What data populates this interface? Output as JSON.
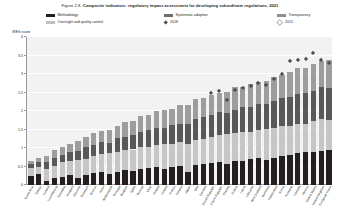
{
  "title": {
    "figure_number": "Figure 2.8.",
    "text": "Composite indicators: regulatory impact assessment for developing subordinate regulations, 2021"
  },
  "legend": {
    "items": [
      {
        "label": "Methodology",
        "type": "swatch",
        "color": "#231f20",
        "key": "meth"
      },
      {
        "label": "Systematic adoption",
        "type": "swatch",
        "color": "#6d6d6d",
        "key": "syst"
      },
      {
        "label": "Transparency",
        "type": "swatch",
        "color": "#8f8f8f",
        "key": "tran"
      },
      {
        "label": "Oversight and quality control",
        "type": "swatch",
        "color": "#bfbfbf",
        "key": "over"
      },
      {
        "label": "2018",
        "type": "diamond-filled",
        "color": "#4d4d4d",
        "key": "y2018"
      },
      {
        "label": "2015",
        "type": "diamond-open",
        "color": "#ffffff",
        "key": "y2015"
      }
    ]
  },
  "chart_data": {
    "type": "bar",
    "stacked": true,
    "title": "Composite indicators: regulatory impact assessment for developing subordinate regulations, 2021",
    "xlabel": "",
    "ylabel": "iREG score",
    "ylim": [
      0,
      4
    ],
    "yticks": [
      0,
      0.5,
      1,
      1.5,
      2,
      2.5,
      3,
      3.5,
      4
    ],
    "ytick_labels": [
      "0",
      "0.5",
      "1",
      "1.5",
      "2",
      "2.5",
      "3",
      "3.5",
      "4"
    ],
    "grid": true,
    "legend_position": "top",
    "categories": [
      "Costa Rica",
      "Türkiye",
      "Iceland",
      "Luxembourg",
      "Colombia",
      "Hungary",
      "Slovenia",
      "Denmark",
      "Greece",
      "Israel",
      "Netherlands",
      "Portugal",
      "Belgium",
      "Spain",
      "Norway",
      "Chile",
      "Poland",
      "Ireland",
      "France",
      "Finland",
      "Japan",
      "Italy",
      "Sweden",
      "Slovak Republic",
      "Czech Republic",
      "Estonia",
      "Austria",
      "Latvia",
      "Lithuania",
      "New Zealand",
      "Germany",
      "Switzerland",
      "Korea",
      "Australia",
      "Canada",
      "Mexico",
      "United States",
      "United Kingdom",
      "European Union"
    ],
    "series": [
      {
        "name": "Methodology",
        "color": "#231f20",
        "values": [
          0.25,
          0.3,
          0.12,
          0.18,
          0.22,
          0.28,
          0.2,
          0.26,
          0.32,
          0.34,
          0.3,
          0.36,
          0.4,
          0.38,
          0.42,
          0.46,
          0.5,
          0.44,
          0.48,
          0.52,
          0.36,
          0.55,
          0.58,
          0.6,
          0.62,
          0.58,
          0.64,
          0.66,
          0.7,
          0.72,
          0.68,
          0.74,
          0.78,
          0.82,
          0.86,
          0.9,
          0.88,
          0.92,
          0.95
        ]
      },
      {
        "name": "Oversight and quality control",
        "color": "#c6c6c6",
        "values": [
          0.22,
          0.18,
          0.3,
          0.34,
          0.4,
          0.36,
          0.48,
          0.44,
          0.46,
          0.5,
          0.56,
          0.52,
          0.54,
          0.58,
          0.6,
          0.56,
          0.58,
          0.66,
          0.62,
          0.64,
          0.74,
          0.68,
          0.66,
          0.7,
          0.72,
          0.8,
          0.76,
          0.78,
          0.74,
          0.76,
          0.84,
          0.8,
          0.82,
          0.78,
          0.8,
          0.76,
          0.84,
          0.86,
          0.8
        ]
      },
      {
        "name": "Systematic adoption",
        "color": "#585858",
        "values": [
          0.1,
          0.14,
          0.2,
          0.22,
          0.18,
          0.26,
          0.24,
          0.34,
          0.3,
          0.32,
          0.28,
          0.38,
          0.36,
          0.4,
          0.42,
          0.48,
          0.46,
          0.44,
          0.52,
          0.5,
          0.54,
          0.56,
          0.6,
          0.58,
          0.62,
          0.56,
          0.64,
          0.66,
          0.68,
          0.7,
          0.66,
          0.72,
          0.74,
          0.78,
          0.8,
          0.84,
          0.82,
          0.86,
          0.88
        ]
      },
      {
        "name": "Transparency",
        "color": "#9d9d9d",
        "values": [
          0.08,
          0.12,
          0.16,
          0.2,
          0.24,
          0.22,
          0.28,
          0.26,
          0.32,
          0.3,
          0.36,
          0.34,
          0.4,
          0.38,
          0.42,
          0.4,
          0.46,
          0.48,
          0.44,
          0.5,
          0.52,
          0.54,
          0.5,
          0.56,
          0.54,
          0.58,
          0.6,
          0.56,
          0.62,
          0.6,
          0.64,
          0.66,
          0.62,
          0.68,
          0.7,
          0.66,
          0.72,
          0.7,
          0.74
        ]
      }
    ],
    "markers": [
      {
        "name": "2018",
        "color": "#4d4d4d",
        "shape": "diamond-filled",
        "values": [
          null,
          null,
          null,
          null,
          null,
          null,
          null,
          null,
          null,
          null,
          null,
          null,
          null,
          null,
          null,
          null,
          null,
          null,
          null,
          null,
          null,
          null,
          null,
          2.5,
          2.55,
          2.3,
          2.58,
          2.62,
          2.7,
          2.78,
          2.72,
          2.88,
          3.0,
          3.35,
          3.38,
          3.42,
          3.58,
          3.4,
          3.32
        ]
      },
      {
        "name": "2015",
        "color": "#ffffff",
        "shape": "diamond-open",
        "values": [
          null,
          null,
          null,
          null,
          null,
          null,
          null,
          null,
          null,
          null,
          null,
          null,
          null,
          null,
          null,
          null,
          null,
          null,
          null,
          null,
          null,
          null,
          null,
          null,
          null,
          null,
          null,
          null,
          null,
          null,
          null,
          null,
          null,
          null,
          null,
          null,
          null,
          null,
          null
        ]
      }
    ]
  }
}
